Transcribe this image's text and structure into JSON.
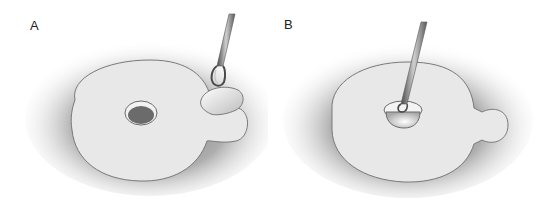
{
  "figure": {
    "panels": [
      {
        "label": "A",
        "description": "Disc-shaped membrane with central hole; forceps lifting a flap at the tab edge"
      },
      {
        "label": "B",
        "description": "Disc-shaped membrane; forceps inserted into central opening"
      }
    ],
    "colors": {
      "background": "#ffffff",
      "disc_fill": "#e8e8e8",
      "disc_outline": "#7a7a7a",
      "shadow": "#6e6e6e",
      "hole_fill": "#6b6b6b",
      "instrument": "#5a5a5a"
    }
  }
}
